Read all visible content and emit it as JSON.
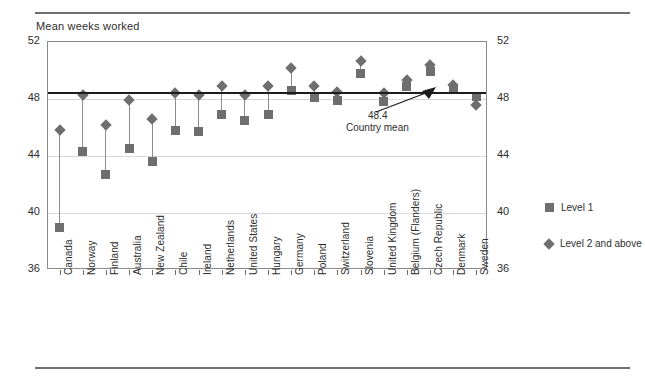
{
  "figure": {
    "axis_title": "Mean weeks worked",
    "marker_color": "#6e6e6e",
    "mean_line_color": "#1d1d1d"
  },
  "annotation": {
    "value": "48.4",
    "label": "Country mean"
  },
  "legend": {
    "items": [
      {
        "name": "level-1",
        "label": "Level 1",
        "marker": "square"
      },
      {
        "name": "level-2-and-above",
        "label": "Level 2 and above",
        "marker": "diamond"
      }
    ]
  },
  "chart_data": {
    "type": "scatter",
    "title": "",
    "subtitle": "",
    "xlabel": "",
    "ylabel": "Mean weeks worked",
    "ylim": [
      36,
      52
    ],
    "yticks": [
      36,
      40,
      44,
      48,
      52
    ],
    "ytick_labels": [
      "36",
      "40",
      "44",
      "48",
      "52"
    ],
    "grid": true,
    "legend_position": "right",
    "mean_line": 48.4,
    "mean_line_label": "Country mean",
    "categories": [
      "Canada",
      "Norway",
      "Finland",
      "Australia",
      "New Zealand",
      "Chile",
      "Ireland",
      "Netherlands",
      "United States",
      "Hungary",
      "Germany",
      "Poland",
      "Switzerland",
      "Slovenia",
      "United Kingdom",
      "Belgium (Flanders)",
      "Czech Republic",
      "Denmark",
      "Sweden"
    ],
    "series": [
      {
        "name": "Level 1",
        "marker": "square",
        "values": [
          39.0,
          44.3,
          42.7,
          44.5,
          43.6,
          45.8,
          45.7,
          46.9,
          46.5,
          46.9,
          48.6,
          48.1,
          47.9,
          49.8,
          47.8,
          48.9,
          49.9,
          48.7,
          48.2
        ]
      },
      {
        "name": "Level 2 and above",
        "marker": "diamond",
        "values": [
          45.8,
          48.3,
          46.2,
          47.9,
          46.6,
          48.4,
          48.3,
          48.9,
          48.3,
          48.9,
          50.2,
          48.9,
          48.5,
          50.7,
          48.4,
          49.3,
          50.4,
          49.0,
          47.6
        ]
      }
    ]
  }
}
